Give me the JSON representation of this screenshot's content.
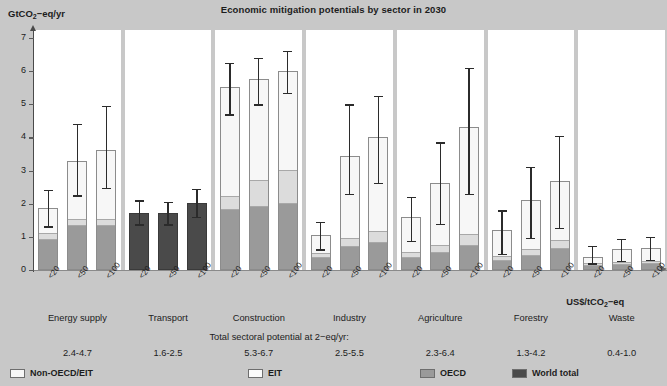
{
  "chart_data": {
    "type": "bar",
    "title": "Economic mitigation potentials by sector in 2030",
    "ylabel": "GtCO2-eq/yr",
    "ylabel_html": "GtCO<sub>2</sub>−eq/yr",
    "xlabel": "US$/tCO2-eq",
    "xlabel_html": "US$/tCO<sub>2</sub>−eq",
    "ylim": [
      0,
      7
    ],
    "yticks": [
      0,
      1,
      2,
      3,
      4,
      5,
      6,
      7
    ],
    "ytick_labels": [
      "0",
      "1",
      "2",
      "3",
      "4",
      "5",
      "6",
      "7"
    ],
    "grid": false,
    "legend_position": "bottom",
    "stack_order": [
      "OECD",
      "EIT",
      "Non-OECD/EIT"
    ],
    "note": "Total sectoral potential at <US$ 100/tCO2-eq/yr:",
    "note_html": "Total sectoral potential at <US$ 100/tCO<sub>2</sub>−eq/yr:",
    "categories": [
      "<20",
      "<50",
      "<100"
    ],
    "series_legend": [
      {
        "name": "Non-OECD/EIT",
        "color": "#f7f7f7"
      },
      {
        "name": "EIT",
        "color": "#fbfbfb"
      },
      {
        "name": "OECD",
        "color": "#9a9a9a"
      },
      {
        "name": "World total",
        "color": "#4a4a4a"
      }
    ],
    "sectors": [
      {
        "name": "Energy supply",
        "total": "2.4-4.7",
        "world_total_only": false,
        "bars": [
          {
            "category": "<20",
            "oecd": 0.9,
            "eit": 0.18,
            "nonoecd": 0.8,
            "total": 1.88,
            "err_low": 1.32,
            "err_high": 2.42
          },
          {
            "category": "<50",
            "oecd": 1.32,
            "eit": 0.18,
            "nonoecd": 1.8,
            "total": 3.3,
            "err_low": 2.25,
            "err_high": 4.4
          },
          {
            "category": "<100",
            "oecd": 1.32,
            "eit": 0.18,
            "nonoecd": 2.13,
            "total": 3.63,
            "err_low": 2.48,
            "err_high": 4.95
          }
        ]
      },
      {
        "name": "Transport",
        "total": "1.6-2.5",
        "world_total_only": true,
        "bars": [
          {
            "category": "<20",
            "total": 1.72,
            "err_low": 1.38,
            "err_high": 2.1
          },
          {
            "category": "<50",
            "total": 1.72,
            "err_low": 1.38,
            "err_high": 2.05
          },
          {
            "category": "<100",
            "total": 2.02,
            "err_low": 1.6,
            "err_high": 2.45
          }
        ]
      },
      {
        "name": "Construction",
        "total": "5.3-6.7",
        "world_total_only": false,
        "bars": [
          {
            "category": "<20",
            "oecd": 1.8,
            "eit": 0.4,
            "nonoecd": 3.33,
            "total": 5.53,
            "err_low": 4.7,
            "err_high": 6.25
          },
          {
            "category": "<50",
            "oecd": 1.9,
            "eit": 0.8,
            "nonoecd": 3.05,
            "total": 5.75,
            "err_low": 5.0,
            "err_high": 6.4
          },
          {
            "category": "<100",
            "oecd": 2.0,
            "eit": 1.0,
            "nonoecd": 3.0,
            "total": 6.0,
            "err_low": 5.35,
            "err_high": 6.62
          }
        ]
      },
      {
        "name": "Industry",
        "total": "2.5-5.5",
        "world_total_only": false,
        "bars": [
          {
            "category": "<20",
            "oecd": 0.35,
            "eit": 0.12,
            "nonoecd": 0.58,
            "total": 1.05,
            "err_low": 0.62,
            "err_high": 1.45
          },
          {
            "category": "<50",
            "oecd": 0.7,
            "eit": 0.25,
            "nonoecd": 2.5,
            "total": 3.45,
            "err_low": 2.3,
            "err_high": 5.0
          },
          {
            "category": "<100",
            "oecd": 0.8,
            "eit": 0.35,
            "nonoecd": 2.85,
            "total": 4.0,
            "err_low": 2.62,
            "err_high": 5.25
          }
        ]
      },
      {
        "name": "Agriculture",
        "total": "2.3-6.4",
        "world_total_only": false,
        "bars": [
          {
            "category": "<20",
            "oecd": 0.35,
            "eit": 0.15,
            "nonoecd": 1.1,
            "total": 1.6,
            "err_low": 0.88,
            "err_high": 2.2
          },
          {
            "category": "<50",
            "oecd": 0.5,
            "eit": 0.22,
            "nonoecd": 1.9,
            "total": 2.62,
            "err_low": 1.4,
            "err_high": 3.85
          },
          {
            "category": "<100",
            "oecd": 0.72,
            "eit": 0.35,
            "nonoecd": 3.25,
            "total": 4.32,
            "err_low": 2.3,
            "err_high": 6.1
          }
        ]
      },
      {
        "name": "Forestry",
        "total": "1.3-4.2",
        "world_total_only": false,
        "bars": [
          {
            "category": "<20",
            "oecd": 0.28,
            "eit": 0.12,
            "nonoecd": 0.8,
            "total": 1.2,
            "err_low": 0.48,
            "err_high": 1.8
          },
          {
            "category": "<50",
            "oecd": 0.42,
            "eit": 0.18,
            "nonoecd": 1.5,
            "total": 2.1,
            "err_low": 0.98,
            "err_high": 3.12
          },
          {
            "category": "<100",
            "oecd": 0.62,
            "eit": 0.25,
            "nonoecd": 1.83,
            "total": 2.7,
            "err_low": 1.28,
            "err_high": 4.05
          }
        ]
      },
      {
        "name": "Waste",
        "total": "0.4-1.0",
        "world_total_only": false,
        "bars": [
          {
            "category": "<20",
            "oecd": 0.12,
            "eit": 0.05,
            "nonoecd": 0.23,
            "total": 0.4,
            "err_low": 0.2,
            "err_high": 0.72
          },
          {
            "category": "<50",
            "oecd": 0.15,
            "eit": 0.06,
            "nonoecd": 0.43,
            "total": 0.64,
            "err_low": 0.28,
            "err_high": 0.95
          },
          {
            "category": "<100",
            "oecd": 0.18,
            "eit": 0.07,
            "nonoecd": 0.4,
            "total": 0.65,
            "err_low": 0.3,
            "err_high": 1.0
          }
        ]
      }
    ]
  },
  "colors": {
    "background": "#c8c8c8",
    "panel": "#ffffff",
    "oecd": "#9a9a9a",
    "eit": "#dcdcdc",
    "nonoecd": "#f7f7f7",
    "world_total": "#4a4a4a",
    "axis": "#4a4a4a",
    "error_bar": "#2b2b2b",
    "text": "#1c1c1c"
  }
}
